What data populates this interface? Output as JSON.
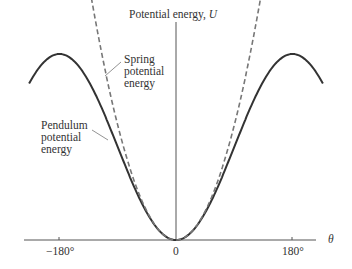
{
  "title": {
    "text": "Potential energy, ",
    "var": "U"
  },
  "x_axis": {
    "label": "θ",
    "ticks": [
      "−180°",
      "0",
      "180°"
    ]
  },
  "labels": {
    "spring": [
      "Spring",
      "potential",
      "energy"
    ],
    "pendulum": [
      "Pendulum",
      "potential",
      "energy"
    ]
  },
  "chart_data": {
    "type": "line",
    "title": "Potential energy, U",
    "xlabel": "θ",
    "ylabel": "Potential energy, U",
    "x_ticks": [
      "-180°",
      "0",
      "180°"
    ],
    "xlim": [
      -225,
      225
    ],
    "series": [
      {
        "name": "Pendulum potential energy",
        "style": "solid",
        "function": "U = 1 - cos(θ)",
        "x": [
          -225,
          -180,
          -90,
          0,
          90,
          180,
          225
        ],
        "y": [
          1.71,
          2,
          1,
          0,
          1,
          2,
          1.71
        ]
      },
      {
        "name": "Spring potential energy",
        "style": "dashed",
        "function": "U = θ²/2 (rad)",
        "x": [
          -142,
          -90,
          0,
          90,
          142
        ],
        "y": [
          3.07,
          1.23,
          0,
          1.23,
          3.07
        ]
      }
    ],
    "grid": false,
    "legend": "inline annotations"
  }
}
